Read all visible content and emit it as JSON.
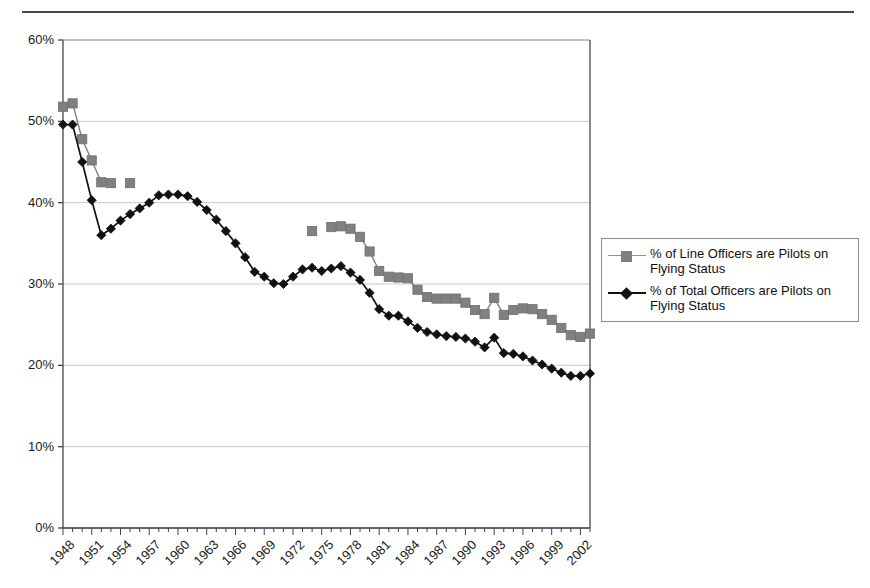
{
  "figure": {
    "top_rule": "horizontal-rule",
    "background": "#ffffff"
  },
  "legend": {
    "position": "right",
    "entries": [
      {
        "label": "% of Line Officers are Pilots on Flying Status",
        "color": "#808080",
        "marker": "square"
      },
      {
        "label": "% of Total Officers are Pilots on Flying Status",
        "color": "#111111",
        "marker": "diamond"
      }
    ]
  },
  "chart_data": {
    "type": "line",
    "title": "",
    "subtitle": "",
    "xlabel": "",
    "ylabel": "",
    "xlim": [
      1948,
      2003
    ],
    "ylim": [
      0,
      60
    ],
    "ytick_labels": [
      "0%",
      "10%",
      "20%",
      "30%",
      "40%",
      "50%",
      "60%"
    ],
    "ytick_values": [
      0,
      10,
      20,
      30,
      40,
      50,
      60
    ],
    "grid": "horizontal",
    "legend_position": "right",
    "x": [
      1948,
      1949,
      1950,
      1951,
      1952,
      1953,
      1954,
      1955,
      1956,
      1957,
      1958,
      1959,
      1960,
      1961,
      1962,
      1963,
      1964,
      1965,
      1966,
      1967,
      1968,
      1969,
      1970,
      1971,
      1972,
      1973,
      1974,
      1975,
      1976,
      1977,
      1978,
      1979,
      1980,
      1981,
      1982,
      1983,
      1984,
      1985,
      1986,
      1987,
      1988,
      1989,
      1990,
      1991,
      1992,
      1993,
      1994,
      1995,
      1996,
      1997,
      1998,
      1999,
      2000,
      2001,
      2002,
      2003
    ],
    "xtick_labels": [
      "1948",
      "1951",
      "1954",
      "1957",
      "1960",
      "1963",
      "1966",
      "1969",
      "1972",
      "1975",
      "1978",
      "1981",
      "1984",
      "1987",
      "1990",
      "1993",
      "1996",
      "1999",
      "2002"
    ],
    "xtick_values": [
      1948,
      1951,
      1954,
      1957,
      1960,
      1963,
      1966,
      1969,
      1972,
      1975,
      1978,
      1981,
      1984,
      1987,
      1990,
      1993,
      1996,
      1999,
      2002
    ],
    "series": [
      {
        "name": "% of Line Officers are Pilots on Flying Status",
        "color": "#808080",
        "marker": "square",
        "values": [
          51.8,
          52.2,
          47.8,
          45.2,
          42.5,
          42.4,
          null,
          42.4,
          null,
          null,
          null,
          null,
          null,
          null,
          null,
          null,
          null,
          null,
          null,
          null,
          null,
          null,
          null,
          null,
          null,
          null,
          36.5,
          null,
          37.0,
          37.1,
          36.8,
          35.8,
          34.0,
          31.6,
          30.9,
          30.8,
          30.7,
          29.3,
          28.4,
          28.2,
          28.2,
          28.2,
          27.7,
          26.8,
          26.3,
          28.3,
          26.2,
          26.8,
          27.0,
          26.9,
          26.3,
          25.6,
          24.6,
          23.7,
          23.5,
          23.9
        ]
      },
      {
        "name": "% of Total Officers are Pilots on Flying Status",
        "color": "#111111",
        "marker": "diamond",
        "values": [
          49.6,
          49.6,
          45.0,
          40.3,
          36.0,
          36.8,
          37.8,
          38.6,
          39.3,
          40.0,
          40.9,
          41.0,
          41.0,
          40.8,
          40.1,
          39.1,
          37.9,
          36.5,
          35.0,
          33.3,
          31.5,
          30.9,
          30.1,
          30.0,
          30.9,
          31.8,
          32.0,
          31.6,
          31.9,
          32.2,
          31.4,
          30.5,
          28.9,
          26.9,
          26.1,
          26.1,
          25.4,
          24.6,
          24.1,
          23.8,
          23.6,
          23.5,
          23.3,
          22.9,
          22.2,
          23.4,
          21.5,
          21.4,
          21.1,
          20.6,
          20.1,
          19.6,
          19.1,
          18.7,
          18.7,
          19.0
        ]
      }
    ]
  }
}
